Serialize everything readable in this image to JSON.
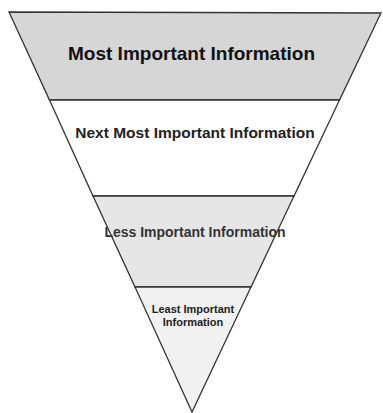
{
  "diagram": {
    "levels": [
      {
        "label": "Most Important Information",
        "fill": "#d6d6d6"
      },
      {
        "label": "Next Most Important Information",
        "fill": "#ffffff"
      },
      {
        "label": "Less Important Information",
        "fill": "#e6e6e6"
      },
      {
        "label": "Least Important Information",
        "fill": "#f1f1f1"
      }
    ],
    "stroke": "#333333"
  }
}
